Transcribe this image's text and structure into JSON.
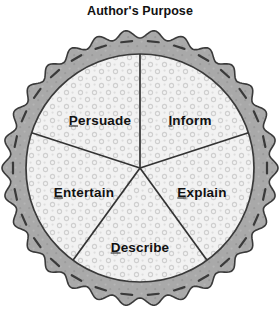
{
  "page": {
    "title": "Author's Purpose",
    "background_color": "#ffffff",
    "text_color": "#111111"
  },
  "diagram": {
    "name": "authors-purpose-pie",
    "shape": "pie",
    "crust_color": "#a9a9a9",
    "crust_outline_color": "#3a3a3a",
    "filling_color": "#f2f2f2",
    "filling_speckle_color": "#c9c9c9",
    "divider_color": "#333333",
    "center_x": 140,
    "center_y": 142,
    "crust_outer_radius": 138,
    "filling_radius": 114,
    "scallop_count": 30,
    "slice_count": 5,
    "slices": [
      {
        "label": "Persuade",
        "first_letter": "P",
        "rest": "ersuade",
        "label_x": 100,
        "label_y": 120
      },
      {
        "label": "Inform",
        "first_letter": "I",
        "rest": "nform",
        "label_x": 190,
        "label_y": 120
      },
      {
        "label": "Explain",
        "first_letter": "E",
        "rest": "xplain",
        "label_x": 202,
        "label_y": 192
      },
      {
        "label": "Describe",
        "first_letter": "D",
        "rest": "escribe",
        "label_x": 140,
        "label_y": 247
      },
      {
        "label": "Entertain",
        "first_letter": "E",
        "rest": "ntertain",
        "label_x": 84,
        "label_y": 192
      }
    ]
  }
}
